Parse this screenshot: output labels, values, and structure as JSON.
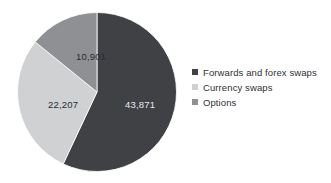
{
  "chart_data": {
    "type": "pie",
    "title": "",
    "subtitle": "",
    "xlabel": "",
    "ylabel": "",
    "legend_position": "right",
    "grid": false,
    "total": 76979,
    "start_angle_deg": 0,
    "direction": "clockwise",
    "categories": [
      "Forwards and forex swaps",
      "Currency swaps",
      "Options"
    ],
    "values": [
      43871,
      22207,
      10901
    ],
    "value_labels": [
      "43,871",
      "22,207",
      "10,901"
    ],
    "percentages": [
      57.0,
      28.8,
      14.2
    ],
    "colors": [
      "#3f4145",
      "#cfd1d3",
      "#8e9093"
    ],
    "slices": [
      {
        "name": "Forwards and forex swaps",
        "value": 43871,
        "label": "43,871",
        "percent": 57.0,
        "color": "#3f4145"
      },
      {
        "name": "Currency swaps",
        "value": 22207,
        "label": "22,207",
        "percent": 28.8,
        "color": "#cfd1d3"
      },
      {
        "name": "Options",
        "value": 10901,
        "label": "10,901",
        "percent": 14.2,
        "color": "#8e9093"
      }
    ]
  },
  "legend": {
    "items": [
      {
        "label": "Forwards and forex swaps",
        "color": "#3f4145"
      },
      {
        "label": "Currency swaps",
        "color": "#cfd1d3"
      },
      {
        "label": "Options",
        "color": "#8e9093"
      }
    ]
  }
}
